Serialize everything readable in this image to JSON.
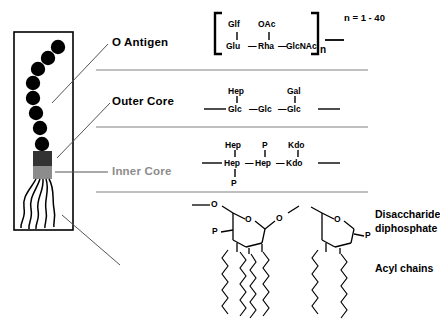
{
  "figure": {
    "line_color": "#000000",
    "divider_color": "#808080",
    "muted_label_color": "#8c8c8c",
    "o_antigen_bead_color": "#000000",
    "outer_core_block_color": "#333333",
    "inner_core_block_color": "#8c8c8c"
  },
  "labels": {
    "o_antigen": "O Antigen",
    "outer_core": "Outer Core",
    "inner_core": "Inner Core",
    "disaccharide_diphosphate_line1": "Disaccharide",
    "disaccharide_diphosphate_line2": "diphosphate",
    "acyl_chains": "Acyl chains"
  },
  "o_antigen": {
    "repeat_count_note": "n = 1 - 40",
    "bracket_subscript": "n",
    "top_branches": [
      {
        "name": "Glf",
        "attached_to": "Glu"
      },
      {
        "name": "OAc",
        "attached_to": "Rha"
      }
    ],
    "backbone": [
      "Glu",
      "Rha",
      "GlcNAc"
    ],
    "bond_symbol": "—"
  },
  "outer_core": {
    "top_branches": [
      {
        "name": "Hep",
        "attached_to": "Glc"
      },
      {
        "name": "Gal",
        "attached_to": "Glc"
      }
    ],
    "backbone": [
      "Glc",
      "Glc",
      "Glc"
    ],
    "bond_symbol": "—"
  },
  "inner_core": {
    "top_branches": [
      {
        "name": "Hep",
        "attached_to": "Hep"
      },
      {
        "name": "P",
        "attached_to": "Hep"
      },
      {
        "name": "Kdo",
        "attached_to": "Kdo"
      }
    ],
    "backbone": [
      "Hep",
      "Hep",
      "Kdo"
    ],
    "bottom_branches": [
      {
        "name": "P",
        "attached_to": "Hep"
      }
    ],
    "bond_symbol": "—"
  },
  "lipid_a": {
    "ring_oxygen_left": "O",
    "ring_oxygen_right": "O",
    "bridge_oxygen": "O",
    "terminal_oxygen": "O",
    "phosphate_left": "P",
    "phosphate_right": "P",
    "acyl_chain_count_left": 4,
    "acyl_chain_count_right": 2
  },
  "cell_diagram": {
    "bead_count": 8,
    "tail_count": 5,
    "blocks": [
      "outer-core-block",
      "inner-core-block"
    ]
  }
}
